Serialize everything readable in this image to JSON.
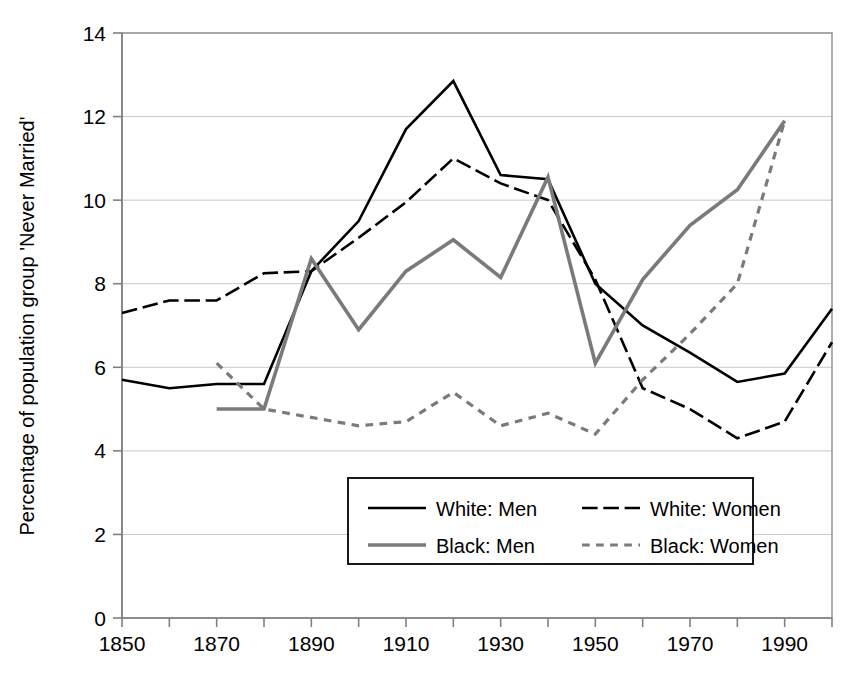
{
  "chart_data": {
    "type": "line",
    "title": "",
    "xlabel": "",
    "ylabel": "Percentage of population group 'Never Married'",
    "xlim": [
      1850,
      2000
    ],
    "ylim": [
      0,
      14
    ],
    "ytick_step": 2,
    "xtick_step": 10,
    "xlabel_step": 20,
    "grid": "horizontal",
    "legend_position": "bottom-center",
    "x_ticks": [
      1850,
      1860,
      1870,
      1880,
      1890,
      1900,
      1910,
      1920,
      1930,
      1940,
      1950,
      1960,
      1970,
      1980,
      1990,
      2000
    ],
    "x_tick_labels": [
      "1850",
      "",
      "1870",
      "",
      "1890",
      "",
      "1910",
      "",
      "1930",
      "",
      "1950",
      "",
      "1970",
      "",
      "1990",
      ""
    ],
    "x_labeled_ticks": [
      "1850",
      "1870",
      "1890",
      "1910",
      "1930",
      "1950",
      "1970",
      "1990"
    ],
    "y_ticks": [
      0,
      2,
      4,
      6,
      8,
      10,
      12,
      14
    ],
    "y_tick_labels": [
      "0",
      "2",
      "4",
      "6",
      "8",
      "10",
      "12",
      "14"
    ],
    "series": [
      {
        "name": "White: Men",
        "style": "solid",
        "color": "#000000",
        "width": 2.6,
        "x": [
          1850,
          1860,
          1870,
          1880,
          1890,
          1900,
          1910,
          1920,
          1930,
          1940,
          1950,
          1960,
          1970,
          1980,
          1990,
          2000
        ],
        "values": [
          5.7,
          5.5,
          5.6,
          5.6,
          8.3,
          9.5,
          11.7,
          12.85,
          10.6,
          10.5,
          8.0,
          7.0,
          6.35,
          5.65,
          5.85,
          7.4
        ]
      },
      {
        "name": "White: Women",
        "style": "dashed",
        "color": "#000000",
        "width": 2.6,
        "x": [
          1850,
          1860,
          1870,
          1880,
          1890,
          1900,
          1910,
          1920,
          1930,
          1940,
          1950,
          1960,
          1970,
          1980,
          1990,
          2000
        ],
        "values": [
          7.3,
          7.6,
          7.6,
          8.25,
          8.3,
          9.1,
          9.95,
          11.0,
          10.4,
          10.0,
          8.1,
          5.5,
          5.0,
          4.3,
          4.7,
          6.6
        ]
      },
      {
        "name": "Black: Men",
        "style": "solid",
        "color": "#7a7a7a",
        "width": 3.6,
        "x": [
          1870,
          1880,
          1890,
          1900,
          1910,
          1920,
          1930,
          1940,
          1950,
          1960,
          1970,
          1980,
          1990
        ],
        "values": [
          5.0,
          5.0,
          8.6,
          6.9,
          8.3,
          9.05,
          8.15,
          10.55,
          6.1,
          8.1,
          9.4,
          10.25,
          11.9
        ]
      },
      {
        "name": "Black: Women",
        "style": "dotted",
        "color": "#7a7a7a",
        "width": 3.2,
        "x": [
          1870,
          1880,
          1890,
          1900,
          1910,
          1920,
          1930,
          1940,
          1950,
          1960,
          1970,
          1980,
          1990
        ],
        "values": [
          6.1,
          5.0,
          4.8,
          4.6,
          4.7,
          5.4,
          4.6,
          4.9,
          4.4,
          5.7,
          6.8,
          8.0,
          11.9
        ]
      }
    ]
  },
  "legend": {
    "entries": [
      {
        "label": "White: Men",
        "style": "solid",
        "color": "#000000"
      },
      {
        "label": "White: Women",
        "style": "dashed",
        "color": "#000000"
      },
      {
        "label": "Black: Men",
        "style": "solid",
        "color": "#7a7a7a"
      },
      {
        "label": "Black: Women",
        "style": "dotted",
        "color": "#7a7a7a"
      }
    ]
  }
}
